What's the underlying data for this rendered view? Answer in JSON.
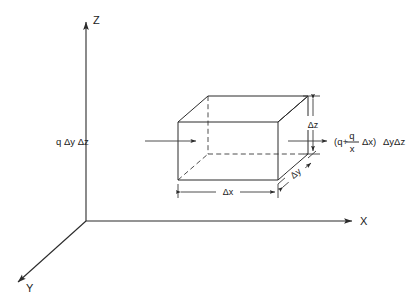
{
  "figure": {
    "type": "technical-diagram",
    "background_color": "#ffffff",
    "line_color": "#2b2b2b"
  },
  "axes": {
    "origin_label": "",
    "items": [
      {
        "name": "x-axis",
        "label": "X",
        "direction": "right"
      },
      {
        "name": "y-axis",
        "label": "Y",
        "direction": "down-left"
      },
      {
        "name": "z-axis",
        "label": "Z",
        "direction": "up"
      }
    ],
    "x_label": "X",
    "y_label": "Y",
    "z_label": "Z"
  },
  "control_volume": {
    "name": "control-volume-box",
    "shape": "rectangular parallelepiped",
    "hidden_edges": "dashed"
  },
  "dimensions": [
    {
      "name": "delta-x",
      "label": "Δx",
      "axis": "x",
      "orientation": "horizontal"
    },
    {
      "name": "delta-y",
      "label": "Δy",
      "axis": "y",
      "orientation": "oblique"
    },
    {
      "name": "delta-z",
      "label": "Δz",
      "axis": "z",
      "orientation": "vertical"
    }
  ],
  "delta_x_label": "Δx",
  "delta_y_label": "Δy",
  "delta_z_label": "Δz",
  "flux": {
    "inflow": {
      "name": "heat-inflow",
      "label": "q Δy Δz",
      "direction": "into left face"
    },
    "outflow": {
      "name": "heat-outflow",
      "direction": "out of right face",
      "expression": {
        "open_paren": "(q+",
        "numerator": "q",
        "denominator": "x",
        "after_fraction": "Δx)",
        "close_terms": "ΔyΔz"
      },
      "label_plain": "(q+ q/x Δx) ΔyΔz"
    }
  }
}
